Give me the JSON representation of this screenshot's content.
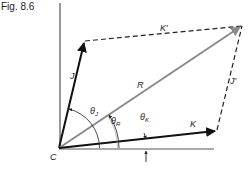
{
  "figure": {
    "label": "Fig. 8.6"
  },
  "vectors": {
    "origin_label": "C",
    "J": "J",
    "K": "K",
    "R": "R",
    "K_prime": "K′",
    "J_prime": "J′"
  },
  "angles": {
    "theta": "θ",
    "J_sub": "J",
    "R_sub": "R",
    "K_sub": "K"
  },
  "colors": {
    "ink": "#111111",
    "resultant": "#8a8a8a",
    "axis": "#555555"
  }
}
